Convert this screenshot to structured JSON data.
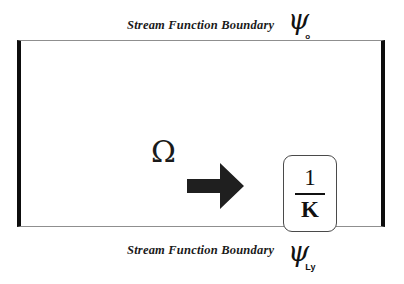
{
  "figure": {
    "background_color": "#ffffff",
    "frame": {
      "name": "computational-domain",
      "side_wall_color": "#0d0d0d",
      "horizontal_edge_color": "#8f8f8f"
    }
  },
  "labels": {
    "top": {
      "text": "Stream Function  Boundary",
      "symbol": "ψ",
      "subscript": "o"
    },
    "bottom": {
      "text": "Stream Function Boundary",
      "symbol": "ψ",
      "subscript": "Ly"
    }
  },
  "interior": {
    "vorticity_symbol": "Ω",
    "arrow": {
      "name": "right-arrow-icon",
      "direction": "right",
      "color": "#1f1f1f"
    },
    "result_box": {
      "numerator": "1",
      "denominator": "K"
    }
  }
}
